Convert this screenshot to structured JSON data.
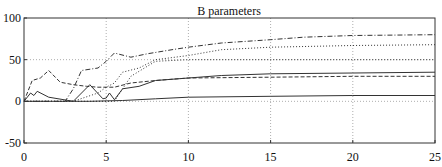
{
  "chart_data": {
    "type": "line",
    "title": "B parameters",
    "xlabel": "",
    "ylabel": "",
    "xlim": [
      0,
      25
    ],
    "ylim": [
      -50,
      100
    ],
    "xticks": [
      0,
      5,
      10,
      15,
      20,
      25
    ],
    "yticks": [
      -50,
      0,
      50,
      100
    ],
    "grid": true,
    "legend": null,
    "series": [
      {
        "name": "solid-1",
        "style": "solid",
        "x": [
          0,
          0.4,
          0.6,
          0.8,
          1.5,
          3.0,
          4.0,
          4.8,
          5.0,
          5.2,
          5.5,
          6.0,
          7.0,
          8.0,
          10.0,
          12.0,
          15.0,
          20.0,
          25.0
        ],
        "y": [
          0,
          10,
          7,
          12,
          5,
          0,
          20,
          3,
          4,
          10,
          2,
          15,
          18,
          25,
          28,
          31,
          33,
          34,
          35
        ]
      },
      {
        "name": "solid-2",
        "style": "solid",
        "x": [
          0,
          2,
          4,
          6,
          8,
          10,
          15,
          20,
          25
        ],
        "y": [
          0,
          0,
          0,
          1,
          3,
          5,
          6,
          7,
          7
        ]
      },
      {
        "name": "dashed",
        "style": "dashed",
        "x": [
          0,
          0.5,
          1.0,
          1.5,
          2.2,
          3.0,
          3.8,
          4.5,
          5.5,
          6.5,
          8.0,
          10.0,
          15.0,
          20.0,
          25.0
        ],
        "y": [
          0,
          25,
          28,
          37,
          23,
          20,
          18,
          17,
          17,
          22,
          25,
          28,
          29,
          30,
          30
        ]
      },
      {
        "name": "dash-dot",
        "style": "dash-dot",
        "x": [
          0,
          2.5,
          3.0,
          3.5,
          4.5,
          5.0,
          5.5,
          6.5,
          7.5,
          9.0,
          10.0,
          12.0,
          15.0,
          17.0,
          20.0,
          25.0
        ],
        "y": [
          0,
          0,
          15,
          37,
          40,
          48,
          58,
          53,
          57,
          62,
          65,
          70,
          74,
          77,
          79,
          80
        ]
      },
      {
        "name": "dotted-1",
        "style": "dotted",
        "x": [
          0,
          3.0,
          4.5,
          5.0,
          5.5,
          6.0,
          7.0,
          8.0,
          10.0,
          12.0,
          15.0,
          20.0,
          25.0
        ],
        "y": [
          0,
          0,
          10,
          17,
          22,
          35,
          40,
          50,
          55,
          62,
          65,
          67,
          68
        ]
      },
      {
        "name": "dotted-2",
        "style": "dotted",
        "x": [
          0,
          5.5,
          6.5,
          8.0,
          10.0,
          15.0,
          20.0,
          25.0
        ],
        "y": [
          0,
          0,
          30,
          48,
          50,
          50,
          50,
          50
        ]
      }
    ]
  }
}
